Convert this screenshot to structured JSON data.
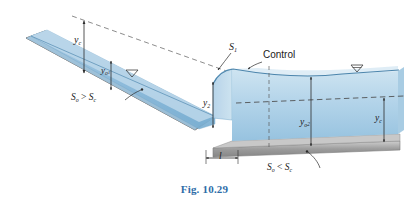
{
  "figure": {
    "caption": "Fig. 10.29",
    "caption_color": "#2e6da8",
    "background": "#ffffff"
  },
  "colors": {
    "water_dark": "#7fb2d4",
    "water_mid": "#a9cbe3",
    "water_light": "#c9e0ef",
    "bed_gray": "#9a9a9a",
    "bed_gray_light": "#c4c4c4",
    "line_dark": "#2b2b2b",
    "dash_gray": "#6f6f6f"
  },
  "labels": {
    "y_c_left": {
      "base": "y",
      "sub": "c"
    },
    "y_o1": {
      "base": "y",
      "sub": "o",
      "sub2": "1"
    },
    "y_2": {
      "base": "y",
      "sub": "2"
    },
    "y_o2": {
      "base": "y",
      "sub": "o",
      "sub2": "2"
    },
    "y_c_right": {
      "base": "y",
      "sub": "c"
    },
    "s1_curve": {
      "base": "S",
      "sub": "1"
    },
    "control": "Control",
    "slope_left": {
      "base1": "S",
      "sub1": "o",
      "op": " > ",
      "base2": "S",
      "sub2": "c"
    },
    "slope_right": {
      "base1": "S",
      "sub1": "o",
      "op": " < ",
      "base2": "S",
      "sub2": "c"
    },
    "length_l": "l",
    "water_surface_symbol": "water-surface-triangle"
  },
  "diagram": {
    "type": "open-channel-flow-profile",
    "regions": [
      {
        "name": "steep-channel",
        "slope": "So > Sc",
        "depth_label": "y_o1",
        "critical_depth_label": "y_c"
      },
      {
        "name": "hydraulic-jump",
        "sequent_depth_label": "y_2",
        "jump_length_label": "l"
      },
      {
        "name": "mild-channel",
        "slope": "So < Sc",
        "normal_depth_label": "y_o2",
        "critical_depth_label": "y_c"
      }
    ],
    "profile_curve": "S1",
    "control_point": "Control"
  }
}
